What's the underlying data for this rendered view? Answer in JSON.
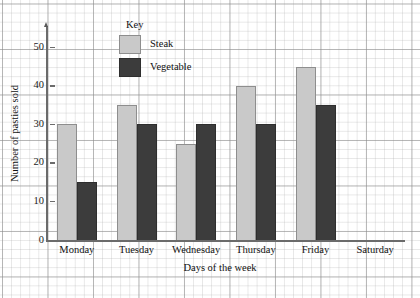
{
  "chart_data": {
    "type": "bar",
    "title": "",
    "xlabel": "Days of the week",
    "ylabel": "Number of pasties sold",
    "categories": [
      "Monday",
      "Tuesday",
      "Wednesday",
      "Thursday",
      "Friday",
      "Saturday"
    ],
    "series": [
      {
        "name": "Steak",
        "color": "#c9c9c9",
        "values": [
          30,
          35,
          25,
          40,
          45,
          0
        ]
      },
      {
        "name": "Vegetable",
        "color": "#3c3c3c",
        "values": [
          15,
          30,
          30,
          30,
          35,
          0
        ]
      }
    ],
    "ylim": [
      0,
      55
    ],
    "yticks": [
      0,
      10,
      20,
      30,
      40,
      50
    ],
    "ytick_labels": [
      "0",
      "10",
      "20",
      "30",
      "40",
      "50"
    ],
    "grid": true,
    "grid_minor_step": 5,
    "legend_position": "inside-top-center",
    "legend_title": "Key"
  },
  "legend": {
    "title": "Key",
    "entries": [
      {
        "label": "Steak",
        "color": "#c9c9c9"
      },
      {
        "label": "Vegetable",
        "color": "#3c3c3c"
      }
    ]
  },
  "axes": {
    "y_title": "Number of pasties sold",
    "x_title": "Days of the week"
  }
}
